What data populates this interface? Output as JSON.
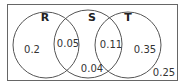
{
  "diagram": {
    "type": "venn",
    "sets": [
      {
        "label": "R"
      },
      {
        "label": "S"
      },
      {
        "label": "T"
      }
    ],
    "regions": {
      "R_only": "0.2",
      "R_and_S": "0.05",
      "S_and_T": "0.11",
      "T_only": "0.35",
      "S_only_bottom": "0.04",
      "outside": "0.25"
    },
    "colors": {
      "stroke": "#555555",
      "text": "#333333",
      "background": "#ffffff"
    }
  }
}
